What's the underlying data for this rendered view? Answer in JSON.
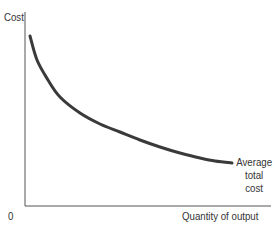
{
  "chart_data": {
    "type": "line",
    "title": "",
    "xlabel": "Quantity of output",
    "ylabel": "Cost",
    "origin_label": "0",
    "grid": false,
    "legend": null,
    "x_ticks": [],
    "y_ticks": [],
    "series": [
      {
        "name": "Average total cost",
        "label_lines": [
          "Average",
          "total",
          "cost"
        ],
        "color": "#3a3a3a",
        "shape": "downward-sloping convex curve",
        "points_px": [
          [
            30,
            36
          ],
          [
            37,
            60
          ],
          [
            48,
            80
          ],
          [
            60,
            97
          ],
          [
            80,
            113
          ],
          [
            100,
            124
          ],
          [
            120,
            132
          ],
          [
            140,
            140
          ],
          [
            160,
            147
          ],
          [
            180,
            153
          ],
          [
            200,
            158
          ],
          [
            215,
            161
          ],
          [
            232,
            163
          ]
        ]
      }
    ],
    "annotations": [
      {
        "text": "Average total cost",
        "anchor": "end of curve",
        "position": "right"
      }
    ],
    "axes": {
      "y_axis_x_px": 25,
      "x_axis_y_px": 206,
      "x_axis_end_px": 271,
      "y_axis_top_px": 12
    }
  },
  "labels": {
    "y_axis": "Cost",
    "x_axis": "Quantity of output",
    "origin": "0",
    "curve": [
      "Average",
      "total",
      "cost"
    ]
  }
}
